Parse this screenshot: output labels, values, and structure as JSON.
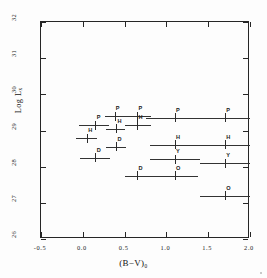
{
  "figure": {
    "background": "#ffffff",
    "axis_color": "#262626",
    "data_color": "#333333"
  },
  "chart_data": {
    "type": "scatter",
    "title": "",
    "subtitle": "",
    "xlabel": "(B−V)₀",
    "ylabel": "Log Lₓ",
    "xlim": [
      -0.5,
      2.0
    ],
    "ylim": [
      26,
      32
    ],
    "grid": false,
    "legend": "none",
    "xticks": [
      -0.5,
      0.0,
      0.5,
      1.0,
      1.5,
      2.0
    ],
    "xticklabels": [
      "-0.5",
      "0.0",
      "0.5",
      "1.0",
      "1.5",
      "2.0"
    ],
    "yticks": [
      26,
      27,
      28,
      29,
      30,
      31,
      32
    ],
    "yticklabels": [
      "26",
      "27",
      "28",
      "29",
      "30",
      "31",
      "32"
    ],
    "error_orientation": "horizontal",
    "annotation_note": "Each point carries a single capital-letter class label drawn just above and right of its marker.",
    "points": [
      {
        "label": "P",
        "x": 0.15,
        "y": 29.15,
        "xerr_lo": 0.2,
        "xerr_hi": 0.16
      },
      {
        "label": "P",
        "x": 0.38,
        "y": 29.4,
        "xerr_lo": 0.12,
        "xerr_hi": 0.23
      },
      {
        "label": "P",
        "x": 0.65,
        "y": 29.4,
        "xerr_lo": 0.14,
        "xerr_hi": 0.16
      },
      {
        "label": "P",
        "x": 1.1,
        "y": 29.35,
        "xerr_lo": 0.34,
        "xerr_hi": 0.33
      },
      {
        "label": "P",
        "x": 1.7,
        "y": 29.35,
        "xerr_lo": 0.3,
        "xerr_hi": 0.31
      },
      {
        "label": "H",
        "x": 0.05,
        "y": 28.78,
        "xerr_lo": 0.13,
        "xerr_hi": 0.12
      },
      {
        "label": "H",
        "x": 0.4,
        "y": 29.05,
        "xerr_lo": 0.12,
        "xerr_hi": 0.11
      },
      {
        "label": "H",
        "x": 0.65,
        "y": 29.15,
        "xerr_lo": 0.14,
        "xerr_hi": 0.17
      },
      {
        "label": "H",
        "x": 1.1,
        "y": 28.6,
        "xerr_lo": 0.3,
        "xerr_hi": 0.3
      },
      {
        "label": "H",
        "x": 1.7,
        "y": 28.6,
        "xerr_lo": 0.3,
        "xerr_hi": 0.31
      },
      {
        "label": "D",
        "x": 0.15,
        "y": 28.25,
        "xerr_lo": 0.18,
        "xerr_hi": 0.18
      },
      {
        "label": "D",
        "x": 0.4,
        "y": 28.55,
        "xerr_lo": 0.12,
        "xerr_hi": 0.12
      },
      {
        "label": "D",
        "x": 0.65,
        "y": 27.75,
        "xerr_lo": 0.15,
        "xerr_hi": 0.17
      },
      {
        "label": "Y",
        "x": 1.1,
        "y": 28.2,
        "xerr_lo": 0.3,
        "xerr_hi": 0.3
      },
      {
        "label": "Y",
        "x": 1.7,
        "y": 28.1,
        "xerr_lo": 0.3,
        "xerr_hi": 0.31
      },
      {
        "label": "O",
        "x": 1.1,
        "y": 27.75,
        "xerr_lo": 0.31,
        "xerr_hi": 0.28
      },
      {
        "label": "O",
        "x": 1.7,
        "y": 27.2,
        "xerr_lo": 0.3,
        "xerr_hi": 0.31
      }
    ]
  }
}
